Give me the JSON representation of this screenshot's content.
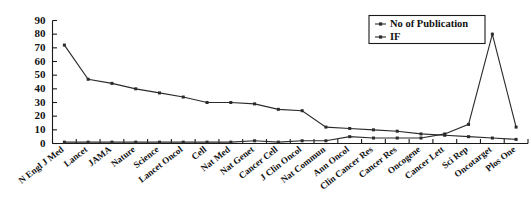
{
  "chart_data": {
    "type": "line",
    "title": "",
    "xlabel": "",
    "ylabel": "",
    "ylim": [
      0,
      90
    ],
    "ytick_step": 10,
    "yticks": [
      0,
      10,
      20,
      30,
      40,
      50,
      60,
      70,
      80,
      90
    ],
    "grid": false,
    "legend_position": "top-right",
    "categories": [
      "N Engl J Med",
      "Lancet",
      "JAMA",
      "Nature",
      "Science",
      "Lancet Oncol",
      "Cell",
      "Nat Med",
      "Nat Genet",
      "Cancer Cell",
      "J Clin Oncol",
      "Nat Commun",
      "Ann Oncol",
      "Clin Cancer Res",
      "Cancer Res",
      "Oncogene",
      "Cancer Lett",
      "Sci Rep",
      "Oncotarget",
      "Plos One"
    ],
    "series": [
      {
        "name": "No of Publication",
        "marker": "square",
        "values": [
          1,
          1,
          1,
          1,
          1,
          1,
          1,
          1,
          2,
          1,
          2,
          2,
          5,
          4,
          4,
          4,
          7,
          14,
          80,
          12
        ]
      },
      {
        "name": "IF",
        "marker": "square",
        "values": [
          72,
          47,
          44,
          40,
          37,
          34,
          30,
          30,
          29,
          25,
          24,
          12,
          11,
          10,
          9,
          7,
          6,
          5,
          4,
          3
        ]
      }
    ]
  },
  "legend": {
    "entries": [
      {
        "label": "No of Publication"
      },
      {
        "label": "IF"
      }
    ]
  },
  "axes": {
    "y_labels": [
      "90",
      "80",
      "70",
      "60",
      "50",
      "40",
      "30",
      "20",
      "10",
      "0"
    ]
  }
}
